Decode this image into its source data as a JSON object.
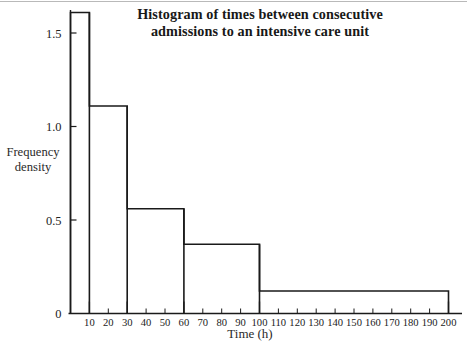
{
  "figure": {
    "name": "histogram-figure",
    "background_color": "#ffffff",
    "ink_color": "#1a1a1a"
  },
  "title": {
    "line1": "Histogram of times between consecutive",
    "line2": "admissions to an intensive care unit",
    "full": "Histogram of times between consecutive admissions to an intensive care unit"
  },
  "axis_titles": {
    "y_line1": "Frequency",
    "y_line2": "density",
    "x": "Time (h)"
  },
  "chart_data": {
    "type": "bar",
    "title": "Histogram of times between consecutive admissions to an intensive care unit",
    "xlabel": "Time (h)",
    "ylabel": "Frequency density",
    "xlim": [
      0,
      200
    ],
    "ylim": [
      0,
      1.62
    ],
    "grid": false,
    "legend": null,
    "bin_edges": [
      0,
      10,
      30,
      60,
      100,
      200
    ],
    "categories": [
      "0-10",
      "10-30",
      "30-60",
      "60-100",
      "100-200"
    ],
    "values": [
      1.61,
      1.11,
      0.56,
      0.37,
      0.12
    ],
    "bars": [
      {
        "label": "0-10",
        "x_start": 0,
        "x_end": 10,
        "frequency_density": 1.61
      },
      {
        "label": "10-30",
        "x_start": 10,
        "x_end": 30,
        "frequency_density": 1.11
      },
      {
        "label": "30-60",
        "x_start": 30,
        "x_end": 60,
        "frequency_density": 0.56
      },
      {
        "label": "60-100",
        "x_start": 60,
        "x_end": 100,
        "frequency_density": 0.37
      },
      {
        "label": "100-200",
        "x_start": 100,
        "x_end": 200,
        "frequency_density": 0.12
      }
    ],
    "y_ticks": [
      {
        "value": 0,
        "label": "0"
      },
      {
        "value": 0.5,
        "label": "0.5"
      },
      {
        "value": 1.0,
        "label": "1.0"
      },
      {
        "value": 1.5,
        "label": "1.5"
      }
    ],
    "x_ticks": [
      {
        "value": 10,
        "label": "10",
        "major": true
      },
      {
        "value": 20,
        "label": "20",
        "major": false
      },
      {
        "value": 30,
        "label": "30",
        "major": true
      },
      {
        "value": 40,
        "label": "40",
        "major": false
      },
      {
        "value": 50,
        "label": "50",
        "major": false
      },
      {
        "value": 60,
        "label": "60",
        "major": true
      },
      {
        "value": 70,
        "label": "70",
        "major": false
      },
      {
        "value": 80,
        "label": "80",
        "major": false
      },
      {
        "value": 90,
        "label": "90",
        "major": false
      },
      {
        "value": 100,
        "label": "100",
        "major": true
      },
      {
        "value": 110,
        "label": "110",
        "major": false
      },
      {
        "value": 120,
        "label": "120",
        "major": false
      },
      {
        "value": 130,
        "label": "130",
        "major": false
      },
      {
        "value": 140,
        "label": "140",
        "major": false
      },
      {
        "value": 150,
        "label": "150",
        "major": false
      },
      {
        "value": 160,
        "label": "160",
        "major": false
      },
      {
        "value": 170,
        "label": "170",
        "major": false
      },
      {
        "value": 180,
        "label": "180",
        "major": false
      },
      {
        "value": 190,
        "label": "190",
        "major": false
      },
      {
        "value": 200,
        "label": "200",
        "major": true
      }
    ]
  }
}
